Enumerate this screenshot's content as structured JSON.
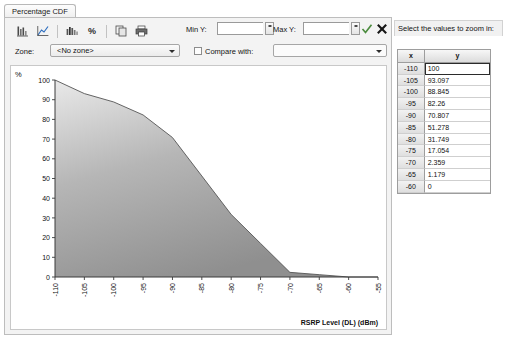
{
  "window": {
    "tab_label": "Percentage CDF"
  },
  "toolbar": {
    "icons": [
      {
        "name": "bar-chart-icon",
        "glyph": "▐"
      },
      {
        "name": "line-chart-icon",
        "glyph": "∕"
      },
      {
        "name": "histogram-icon",
        "glyph": "┳"
      },
      {
        "name": "percent-icon",
        "glyph": "%"
      },
      {
        "name": "copy-icon",
        "glyph": "⧉"
      },
      {
        "name": "print-icon",
        "glyph": "⎙"
      }
    ],
    "min_y_label": "Min Y:",
    "min_y_value": "",
    "min_y_placeholder": "",
    "max_y_label": "Max Y:",
    "max_y_value": "",
    "max_y_placeholder": "",
    "accept_label": "✓",
    "cancel_label": "✕"
  },
  "filters": {
    "zone_label": "Zone:",
    "zone_value": "<No zone>",
    "compare_label": "Compare with:",
    "compare_checked": false,
    "compare_value": ""
  },
  "side_panel": {
    "title": "Select the values to zoom in:",
    "columns": [
      "x",
      "y"
    ],
    "selected_row_index": 0,
    "rows": [
      {
        "x": "-110",
        "y": "100"
      },
      {
        "x": "-105",
        "y": "93.097"
      },
      {
        "x": "-100",
        "y": "88.845"
      },
      {
        "x": "-95",
        "y": "82.26"
      },
      {
        "x": "-90",
        "y": "70.807"
      },
      {
        "x": "-85",
        "y": "51.278"
      },
      {
        "x": "-80",
        "y": "31.749"
      },
      {
        "x": "-75",
        "y": "17.054"
      },
      {
        "x": "-70",
        "y": "2.359"
      },
      {
        "x": "-65",
        "y": "1.179"
      },
      {
        "x": "-60",
        "y": "0"
      }
    ]
  },
  "chart_data": {
    "type": "area",
    "title": "Percentage CDF",
    "xlabel": "RSRP Level (DL) (dBm)",
    "ylabel": "%",
    "x": [
      -110,
      -105,
      -100,
      -95,
      -90,
      -85,
      -80,
      -75,
      -70,
      -65,
      -60
    ],
    "values": [
      100,
      93.097,
      88.845,
      82.26,
      70.807,
      51.278,
      31.749,
      17.054,
      2.359,
      1.179,
      0
    ],
    "xticks": [
      -110,
      -105,
      -100,
      -95,
      -90,
      -85,
      -80,
      -75,
      -70,
      -65,
      -60,
      -55
    ],
    "xtick_labels": [
      "-110",
      "-105",
      "-100",
      "-95",
      "-90",
      "-85",
      "-80",
      "-75",
      "-70",
      "-65",
      "-60",
      "-55"
    ],
    "yticks": [
      0,
      10,
      20,
      30,
      40,
      50,
      60,
      70,
      80,
      90,
      100
    ],
    "ytick_labels": [
      "0",
      "10",
      "20",
      "30",
      "40",
      "50",
      "60",
      "70",
      "80",
      "90",
      "100"
    ],
    "xlim": [
      -110,
      -55
    ],
    "ylim": [
      0,
      100
    ],
    "grid": false,
    "legend": "none",
    "fill_color": "#a8a8a8",
    "line_color": "#555555"
  },
  "colors": {
    "panel_bg": "#f3f3f3",
    "plot_bg": "#ffffff",
    "border": "#bdbdbd",
    "text": "#111111"
  }
}
